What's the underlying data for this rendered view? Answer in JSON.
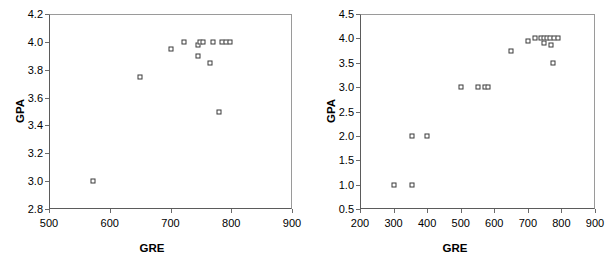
{
  "chart_data": [
    {
      "type": "scatter",
      "title": "",
      "xlabel": "GRE",
      "ylabel": "GPA",
      "xlim": [
        500,
        900
      ],
      "ylim": [
        2.8,
        4.2
      ],
      "xticks": [
        500,
        600,
        700,
        800,
        900
      ],
      "yticks": [
        2.8,
        3.0,
        3.2,
        3.4,
        3.6,
        3.8,
        4.0,
        4.2
      ],
      "xtick_labels": [
        "500",
        "600",
        "700",
        "800",
        "900"
      ],
      "ytick_labels": [
        "2.8",
        "3.0",
        "3.2",
        "3.4",
        "3.6",
        "3.8",
        "4.0",
        "4.2"
      ],
      "grid": false,
      "legend": false,
      "marker": "open-square",
      "points": [
        {
          "x": 573,
          "y": 3.0
        },
        {
          "x": 650,
          "y": 3.75
        },
        {
          "x": 700,
          "y": 3.95
        },
        {
          "x": 723,
          "y": 4.0
        },
        {
          "x": 745,
          "y": 3.98
        },
        {
          "x": 748,
          "y": 4.0
        },
        {
          "x": 745,
          "y": 3.9
        },
        {
          "x": 753,
          "y": 4.0
        },
        {
          "x": 765,
          "y": 3.85
        },
        {
          "x": 770,
          "y": 4.0
        },
        {
          "x": 785,
          "y": 4.0
        },
        {
          "x": 792,
          "y": 4.0
        },
        {
          "x": 798,
          "y": 4.0
        },
        {
          "x": 780,
          "y": 3.5
        }
      ]
    },
    {
      "type": "scatter",
      "title": "",
      "xlabel": "GRE",
      "ylabel": "GPA",
      "xlim": [
        200,
        900
      ],
      "ylim": [
        0.5,
        4.5
      ],
      "xticks": [
        200,
        300,
        400,
        500,
        600,
        700,
        800,
        900
      ],
      "yticks": [
        0.5,
        1.0,
        1.5,
        2.0,
        2.5,
        3.0,
        3.5,
        4.0,
        4.5
      ],
      "xtick_labels": [
        "200",
        "300",
        "400",
        "500",
        "600",
        "700",
        "800",
        "900"
      ],
      "ytick_labels": [
        "0.5",
        "1.0",
        "1.5",
        "2.0",
        "2.5",
        "3.0",
        "3.5",
        "4.0",
        "4.5"
      ],
      "grid": false,
      "legend": false,
      "marker": "open-square",
      "points": [
        {
          "x": 300,
          "y": 1.0
        },
        {
          "x": 355,
          "y": 1.0
        },
        {
          "x": 355,
          "y": 2.0
        },
        {
          "x": 400,
          "y": 2.0
        },
        {
          "x": 500,
          "y": 3.0
        },
        {
          "x": 550,
          "y": 3.0
        },
        {
          "x": 572,
          "y": 3.0
        },
        {
          "x": 582,
          "y": 3.0
        },
        {
          "x": 650,
          "y": 3.75
        },
        {
          "x": 700,
          "y": 3.95
        },
        {
          "x": 722,
          "y": 4.0
        },
        {
          "x": 740,
          "y": 4.0
        },
        {
          "x": 748,
          "y": 4.0
        },
        {
          "x": 748,
          "y": 3.9
        },
        {
          "x": 756,
          "y": 4.0
        },
        {
          "x": 765,
          "y": 4.0
        },
        {
          "x": 770,
          "y": 3.87
        },
        {
          "x": 778,
          "y": 4.0
        },
        {
          "x": 790,
          "y": 4.0
        },
        {
          "x": 775,
          "y": 3.5
        }
      ]
    }
  ],
  "colors": {
    "marker_edge": "#3a3a3a",
    "axis": "#5b5b5b",
    "text": "#000000",
    "background": "#ffffff"
  }
}
